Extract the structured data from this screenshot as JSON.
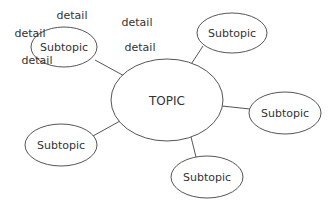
{
  "diagram": {
    "type": "mind-map",
    "topic": {
      "label": "TOPIC",
      "cx": 167,
      "cy": 100,
      "rx": 56,
      "ry": 41
    },
    "subtopics": [
      {
        "label": "Subtopic",
        "cx": 64,
        "cy": 47,
        "rx": 33,
        "ry": 20,
        "edge": [
          128,
          78,
          95,
          60
        ]
      },
      {
        "label": "Subtopic",
        "cx": 232,
        "cy": 33,
        "rx": 35,
        "ry": 20,
        "edge": [
          186,
          72,
          203,
          46
        ]
      },
      {
        "label": "Subtopic",
        "cx": 285,
        "cy": 113,
        "rx": 36,
        "ry": 21,
        "edge": [
          222,
          106,
          250,
          109
        ]
      },
      {
        "label": "Subtopic",
        "cx": 61,
        "cy": 145,
        "rx": 36,
        "ry": 21,
        "edge": [
          120,
          121,
          93,
          136
        ]
      },
      {
        "label": "Subtopic",
        "cx": 207,
        "cy": 177,
        "rx": 36,
        "ry": 21,
        "edge": [
          191,
          137,
          196,
          157
        ]
      }
    ],
    "details": [
      {
        "label": "detail",
        "x": 72,
        "y": 16
      },
      {
        "label": "detail",
        "x": 137,
        "y": 23
      },
      {
        "label": "detail",
        "x": 30,
        "y": 34
      },
      {
        "label": "detail",
        "x": 140,
        "y": 48
      },
      {
        "label": "detail",
        "x": 37,
        "y": 61
      }
    ]
  }
}
